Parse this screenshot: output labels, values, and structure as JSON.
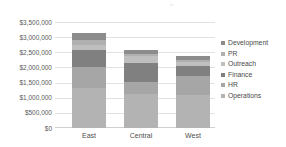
{
  "chart_data": {
    "type": "bar",
    "subtype": "stacked-column",
    "title": "",
    "xlabel": "",
    "ylabel": "",
    "categories": [
      "East",
      "Central",
      "West"
    ],
    "ylim": [
      0,
      3500000
    ],
    "ytick_values": [
      0,
      500000,
      1000000,
      1500000,
      2000000,
      2500000,
      3000000,
      3500000
    ],
    "ytick_labels": [
      "$0",
      "$500,000",
      "$1,000,000",
      "$1,500,000",
      "$2,000,000",
      "$2,500,000",
      "$3,000,000",
      "$3,500,000"
    ],
    "grid": true,
    "legend_position": "right",
    "series": [
      {
        "name": "Operations",
        "color": "#b3b3b3",
        "values": [
          1320000,
          1120000,
          1080000
        ]
      },
      {
        "name": "HR",
        "color": "#a6a6a6",
        "values": [
          700000,
          400000,
          650000
        ]
      },
      {
        "name": "Finance",
        "color": "#808080",
        "values": [
          570000,
          630000,
          330000
        ]
      },
      {
        "name": "Outreach",
        "color": "#bfbfbf",
        "values": [
          160000,
          230000,
          130000
        ]
      },
      {
        "name": "PR",
        "color": "#b0b0b0",
        "values": [
          170000,
          70000,
          50000
        ]
      },
      {
        "name": "Development",
        "color": "#8c8c8c",
        "values": [
          230000,
          130000,
          140000
        ]
      }
    ],
    "totals": [
      3150000,
      2580000,
      2380000
    ]
  }
}
